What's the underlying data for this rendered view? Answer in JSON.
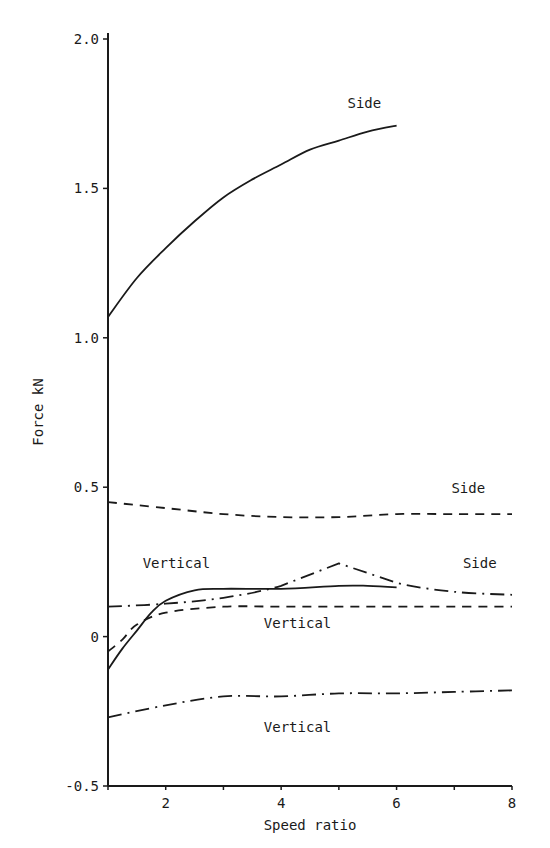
{
  "chart_data": {
    "type": "line",
    "title": "",
    "xlabel": "Speed ratio",
    "ylabel": "Force kN",
    "xlim": [
      1,
      8
    ],
    "ylim": [
      -0.5,
      2.0
    ],
    "x_ticks": [
      2,
      4,
      6,
      8
    ],
    "x_tick_labels": [
      "2",
      "4",
      "6",
      "8"
    ],
    "y_ticks": [
      -0.5,
      0,
      0.5,
      1.0,
      1.5,
      2.0
    ],
    "y_tick_labels": [
      "-0.5",
      "0",
      "0.5",
      "1.0",
      "1.5",
      "2.0"
    ],
    "grid": false,
    "legend": "none (curves labelled directly)",
    "series": [
      {
        "name": "Side",
        "style": "solid",
        "x": [
          1,
          1.5,
          2,
          2.5,
          3,
          3.5,
          4,
          4.5,
          5,
          5.5,
          6
        ],
        "values": [
          1.07,
          1.2,
          1.3,
          1.39,
          1.47,
          1.53,
          1.58,
          1.63,
          1.66,
          1.69,
          1.71
        ],
        "label": "Side",
        "label_pos": [
          5.15,
          1.77
        ]
      },
      {
        "name": "Side",
        "style": "dashed",
        "x": [
          1,
          2,
          3,
          4,
          5,
          6,
          7,
          8
        ],
        "values": [
          0.45,
          0.43,
          0.41,
          0.4,
          0.4,
          0.41,
          0.41,
          0.41
        ],
        "label": "Side",
        "label_pos": [
          6.95,
          0.48
        ]
      },
      {
        "name": "Side",
        "style": "dash-dot",
        "x": [
          1,
          2,
          3,
          4,
          5,
          6,
          7,
          8
        ],
        "values": [
          0.1,
          0.11,
          0.13,
          0.17,
          0.245,
          0.18,
          0.15,
          0.14
        ],
        "label": "Side",
        "label_pos": [
          7.15,
          0.23
        ]
      },
      {
        "name": "Vertical",
        "style": "solid",
        "x": [
          1,
          1.25,
          1.5,
          1.75,
          2,
          2.5,
          3,
          4,
          5,
          5.5,
          6
        ],
        "values": [
          -0.11,
          -0.04,
          0.02,
          0.08,
          0.12,
          0.155,
          0.16,
          0.16,
          0.17,
          0.17,
          0.165
        ],
        "label": "Vertical",
        "label_pos": [
          1.6,
          0.23
        ]
      },
      {
        "name": "Vertical",
        "style": "dashed",
        "x": [
          1,
          1.25,
          1.5,
          2,
          3,
          4,
          5,
          6,
          7,
          8
        ],
        "values": [
          -0.05,
          -0.01,
          0.04,
          0.08,
          0.1,
          0.1,
          0.1,
          0.1,
          0.1,
          0.1
        ],
        "label": "Vertical",
        "label_pos": [
          3.7,
          0.03
        ]
      },
      {
        "name": "Vertical",
        "style": "dash-dot",
        "x": [
          1,
          2,
          3,
          4,
          5,
          6,
          7,
          8
        ],
        "values": [
          -0.27,
          -0.23,
          -0.2,
          -0.2,
          -0.19,
          -0.19,
          -0.185,
          -0.18
        ],
        "label": "Vertical",
        "label_pos": [
          3.7,
          -0.32
        ]
      }
    ]
  },
  "axes": {
    "xlabel": "Speed ratio",
    "ylabel": "Force kN"
  },
  "labels": {
    "side_solid": "Side",
    "side_dashed": "Side",
    "side_dashdot": "Side",
    "vertical_solid": "Vertical",
    "vertical_dashed": "Vertical",
    "vertical_dashdot": "Vertical"
  },
  "colors": {
    "ink": "#1a1a1a",
    "background": "#ffffff"
  }
}
